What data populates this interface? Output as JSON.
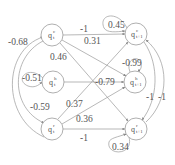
{
  "diagram": {
    "type": "weighted-transition-graph",
    "nodes": [
      {
        "id": "qc_t",
        "base": "q",
        "sup": "c",
        "sub": "t",
        "x": 52,
        "y": 35
      },
      {
        "id": "qh_t",
        "base": "q",
        "sup": "h",
        "sub": "t",
        "x": 53,
        "y": 82
      },
      {
        "id": "qr_t",
        "base": "q",
        "sup": "r",
        "sub": "t",
        "x": 52,
        "y": 129
      },
      {
        "id": "qc_t1",
        "base": "q",
        "sup": "c",
        "sub": "t+1",
        "x": 136,
        "y": 34
      },
      {
        "id": "qh_t1",
        "base": "q",
        "sup": "h",
        "sub": "t+1",
        "x": 135,
        "y": 82
      },
      {
        "id": "qr_t1",
        "base": "q",
        "sup": "r",
        "sub": "t+1",
        "x": 136,
        "y": 129
      }
    ],
    "edges": [
      {
        "from": "qc_t",
        "to": "qc_t1",
        "weight": "-1"
      },
      {
        "from": "qc_t",
        "to": "qh_t1",
        "weight": "0.31"
      },
      {
        "from": "qc_t",
        "to": "qr_t1",
        "weight": "0.46"
      },
      {
        "from": "qh_t",
        "to": "qh_t1",
        "weight": "-0.79"
      },
      {
        "from": "qr_t",
        "to": "qc_t1",
        "weight": "0.37"
      },
      {
        "from": "qr_t",
        "to": "qh_t1",
        "weight": "0.36"
      },
      {
        "from": "qr_t",
        "to": "qr_t1",
        "weight": "-1"
      },
      {
        "from": "qr_t",
        "to": "qc_t",
        "weight": "-0.68"
      },
      {
        "from": "qc_t",
        "to": "qr_t",
        "weight": "-0.59"
      },
      {
        "from": "qc_t1",
        "to": "qr_t1",
        "weight": "-1"
      },
      {
        "from": "qr_t1",
        "to": "qc_t1",
        "weight": "-1"
      }
    ],
    "self_loops": [
      {
        "node": "qh_t",
        "weight": "-0.51"
      },
      {
        "node": "qc_t1",
        "weight": "0.45"
      },
      {
        "node": "qh_t1",
        "weight": "-0.99"
      },
      {
        "node": "qr_t1",
        "weight": "0.34"
      }
    ],
    "labels": {
      "qc_t_to_qc_t1": "-1",
      "qc_t_to_qh_t1": "0.31",
      "qc_t_to_qr_t1": "0.46",
      "qh_t_to_qh_t1": "-0.79",
      "qr_t_to_qc_t1": "0.37",
      "qr_t_to_qh_t1": "0.36",
      "qr_t_to_qr_t1": "-1",
      "qr_t_to_qc_t": "-0.68",
      "qc_t_to_qr_t": "-0.59",
      "qc_t1_to_qr_t1": "-1",
      "qr_t1_to_qc_t1": "-1",
      "loop_qh_t": "-0.51",
      "loop_qc_t1": "0.45",
      "loop_qh_t1": "-0.99",
      "loop_qr_t1": "0.34"
    },
    "node_text": {
      "qc_t": {
        "base": "q",
        "sup": "c",
        "sub": "t"
      },
      "qh_t": {
        "base": "q",
        "sup": "h",
        "sub": "t"
      },
      "qr_t": {
        "base": "q",
        "sup": "r",
        "sub": "t"
      },
      "qc_t1": {
        "base": "q",
        "sup": "c",
        "sub": "t+1"
      },
      "qh_t1": {
        "base": "q",
        "sup": "h",
        "sub": "t+1"
      },
      "qr_t1": {
        "base": "q",
        "sup": "r",
        "sub": "t+1"
      }
    }
  }
}
